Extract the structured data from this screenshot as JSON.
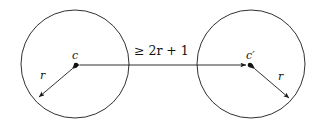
{
  "figure": {
    "caption_type": "geometry-diagram",
    "background_color": "#ffffff",
    "stroke_color": "#1a1a1a",
    "labels": {
      "left_center": "c",
      "right_center": "c′",
      "left_radius": "r",
      "right_radius": "r",
      "distance": "≥ 2r + 1"
    },
    "shapes": {
      "left_circle": {
        "cx": 75,
        "cy": 64,
        "r": 54
      },
      "right_circle": {
        "cx": 251,
        "cy": 64,
        "r": 54
      },
      "left_center_dot": {
        "x": 76,
        "y": 65
      },
      "right_center_dot": {
        "x": 250,
        "y": 65
      },
      "distance_arrow": {
        "x1": 78,
        "y1": 65,
        "x2": 248,
        "y2": 65
      },
      "left_radius_arrow": {
        "x1": 73,
        "y1": 68,
        "x2": 38,
        "y2": 98
      },
      "right_radius_arrow": {
        "x1": 254,
        "y1": 68,
        "x2": 290,
        "y2": 99
      }
    },
    "label_positions": {
      "left_center": {
        "x": 72,
        "y": 51
      },
      "right_center": {
        "x": 246,
        "y": 51
      },
      "left_radius": {
        "x": 40,
        "y": 71
      },
      "right_radius": {
        "x": 278,
        "y": 72
      },
      "distance": {
        "x": 133,
        "y": 46
      }
    }
  }
}
